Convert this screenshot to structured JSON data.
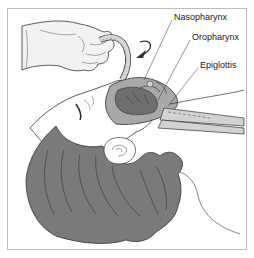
{
  "figure": {
    "labels": [
      {
        "id": "nasopharynx",
        "text": "Nasopharynx",
        "x": 174,
        "y": 16
      },
      {
        "id": "oropharynx",
        "text": "Oropharynx",
        "x": 192,
        "y": 36
      },
      {
        "id": "epiglottis",
        "text": "Epiglottis",
        "x": 200,
        "y": 64
      }
    ]
  },
  "colors": {
    "hair": "#7a7a7a",
    "tissue_dark": "#6e6e6e",
    "tissue_mid": "#a8a8a8",
    "tissue_light": "#d2d2d2",
    "glove": "#f2f2f2",
    "outline": "#333333",
    "frame": "#bdbdbd"
  }
}
